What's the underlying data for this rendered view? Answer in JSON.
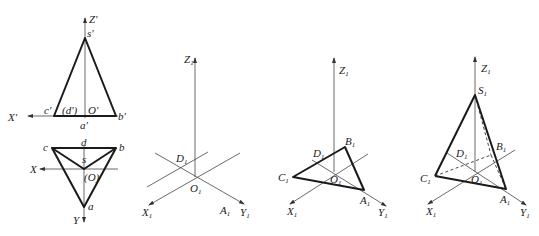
{
  "panel1": {
    "front_view": {
      "z_axis": "Z'",
      "x_axis": "X'",
      "apex": "s'",
      "left": "c'",
      "middle": "(d')",
      "origin": "O'",
      "right": "b'",
      "bottom": "a'"
    },
    "top_view": {
      "x_axis": "X",
      "y_axis": "Y",
      "c": "c",
      "d": "d",
      "b": "b",
      "s": "s",
      "origin": "(O)",
      "a": "a"
    }
  },
  "panel2": {
    "z_axis": "Z",
    "x_axis": "X",
    "y_axis": "Y",
    "origin": "O",
    "d": "D",
    "a": "A",
    "sub": "1"
  },
  "panel3": {
    "z_axis": "Z",
    "x_axis": "X",
    "y_axis": "Y",
    "origin": "O",
    "d": "D",
    "a": "A",
    "b": "B",
    "c": "C",
    "sub": "1"
  },
  "panel4": {
    "z_axis": "Z",
    "x_axis": "X",
    "y_axis": "Y",
    "origin": "O",
    "d": "D",
    "a": "A",
    "b": "B",
    "c": "C",
    "s": "S",
    "sub": "1"
  }
}
